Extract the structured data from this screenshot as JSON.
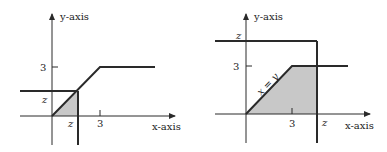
{
  "panels": [
    {
      "id": "left",
      "y_axis_label": "y-axis",
      "x_axis_label": "x-axis",
      "y_tick_3": "3",
      "y_tick_z": "z",
      "x_tick_z": "z",
      "x_tick_3": "3"
    },
    {
      "id": "right",
      "y_axis_label": "y-axis",
      "x_axis_label": "x-axis",
      "y_tick_z": "z",
      "y_tick_3": "3",
      "x_tick_3": "3",
      "x_tick_z": "z",
      "line_label": "x = y"
    }
  ],
  "colors": {
    "line": "#2a2a2a",
    "shade": "#c8c8c8"
  }
}
